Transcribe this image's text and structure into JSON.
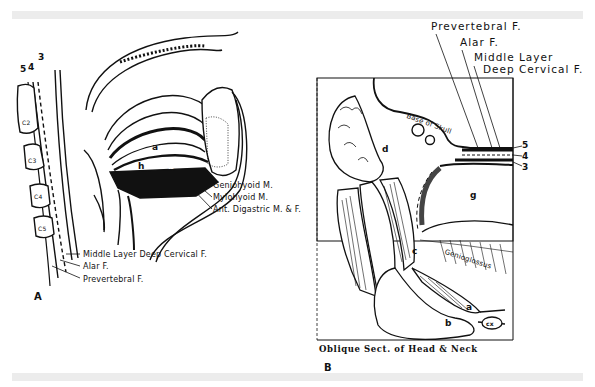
{
  "figure": {
    "panel_a": {
      "id_label": "A",
      "layer_numbers": [
        "5",
        "4",
        "3"
      ],
      "vertebrae": [
        "C2",
        "C3",
        "C4",
        "C5"
      ],
      "region_letters": [
        "a",
        "b",
        "h"
      ],
      "muscle_labels": [
        "Geniohyoid M.",
        "Mylohyoid M.",
        "Ant. Digastric M. & F."
      ],
      "fascia_labels": [
        "Middle Layer Deep Cervical F.",
        "Alar F.",
        "Prevertebral F."
      ]
    },
    "panel_b": {
      "id_label": "B",
      "caption": "Oblique Sect. of Head & Neck",
      "fascia_labels": [
        "Prevertebral F.",
        "Alar F.",
        "Middle Layer",
        "Deep Cervical F."
      ],
      "layer_numbers": [
        "5",
        "4",
        "3"
      ],
      "structure_labels": [
        "Base of Skull",
        "Genioglossus",
        "cx"
      ],
      "region_letters": [
        "d",
        "g",
        "c",
        "a",
        "b"
      ]
    }
  }
}
